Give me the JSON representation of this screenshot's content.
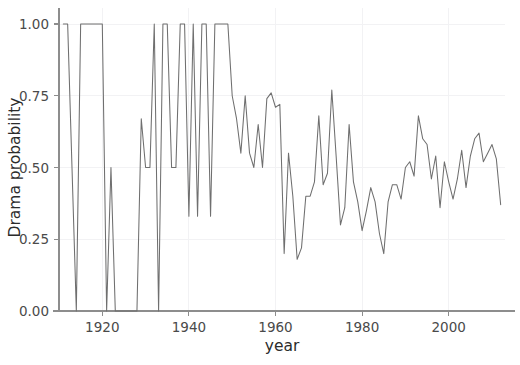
{
  "chart_data": {
    "type": "line",
    "title": "",
    "xlabel": "year",
    "ylabel": "Drama probability",
    "xlim": [
      1910,
      2013
    ],
    "ylim": [
      0.0,
      1.0
    ],
    "grid": true,
    "legend": null,
    "legend_position": "none",
    "line_color": "#6f6f6f",
    "x_ticks": [
      1920,
      1940,
      1960,
      1980,
      2000
    ],
    "x_tick_labels": [
      "1920",
      "1940",
      "1960",
      "1980",
      "2000"
    ],
    "y_ticks": [
      0.0,
      0.25,
      0.5,
      0.75,
      1.0
    ],
    "y_tick_labels": [
      "0.00",
      "0.25",
      "0.50",
      "0.75",
      "1.00"
    ],
    "series": [
      {
        "name": "Drama probability",
        "x": [
          1911,
          1912,
          1913,
          1914,
          1915,
          1916,
          1917,
          1918,
          1919,
          1920,
          1921,
          1922,
          1923,
          1924,
          1925,
          1926,
          1927,
          1928,
          1929,
          1930,
          1931,
          1932,
          1933,
          1934,
          1935,
          1936,
          1937,
          1938,
          1939,
          1940,
          1941,
          1942,
          1943,
          1944,
          1945,
          1946,
          1947,
          1948,
          1949,
          1950,
          1951,
          1952,
          1953,
          1954,
          1955,
          1956,
          1957,
          1958,
          1959,
          1960,
          1961,
          1962,
          1963,
          1964,
          1965,
          1966,
          1967,
          1968,
          1969,
          1970,
          1971,
          1972,
          1973,
          1974,
          1975,
          1976,
          1977,
          1978,
          1979,
          1980,
          1981,
          1982,
          1983,
          1984,
          1985,
          1986,
          1987,
          1988,
          1989,
          1990,
          1991,
          1992,
          1993,
          1994,
          1995,
          1996,
          1997,
          1998,
          1999,
          2000,
          2001,
          2002,
          2003,
          2004,
          2005,
          2006,
          2007,
          2008,
          2009,
          2010,
          2011,
          2012
        ],
        "y": [
          1.0,
          1.0,
          0.5,
          0.0,
          1.0,
          1.0,
          1.0,
          1.0,
          1.0,
          1.0,
          0.0,
          0.5,
          0.0,
          0.0,
          0.0,
          0.0,
          0.0,
          0.0,
          0.67,
          0.5,
          0.5,
          1.0,
          0.0,
          1.0,
          1.0,
          0.5,
          0.5,
          1.0,
          1.0,
          0.33,
          1.0,
          0.33,
          1.0,
          1.0,
          0.33,
          1.0,
          1.0,
          1.0,
          1.0,
          0.75,
          0.67,
          0.55,
          0.75,
          0.55,
          0.5,
          0.65,
          0.5,
          0.74,
          0.76,
          0.71,
          0.72,
          0.2,
          0.55,
          0.4,
          0.18,
          0.22,
          0.4,
          0.4,
          0.45,
          0.68,
          0.44,
          0.48,
          0.77,
          0.54,
          0.3,
          0.36,
          0.65,
          0.45,
          0.38,
          0.28,
          0.35,
          0.43,
          0.38,
          0.27,
          0.2,
          0.38,
          0.44,
          0.44,
          0.39,
          0.5,
          0.52,
          0.47,
          0.68,
          0.6,
          0.58,
          0.46,
          0.54,
          0.36,
          0.52,
          0.45,
          0.39,
          0.46,
          0.56,
          0.43,
          0.54,
          0.6,
          0.62,
          0.52,
          0.55,
          0.58,
          0.53,
          0.37
        ]
      }
    ]
  }
}
